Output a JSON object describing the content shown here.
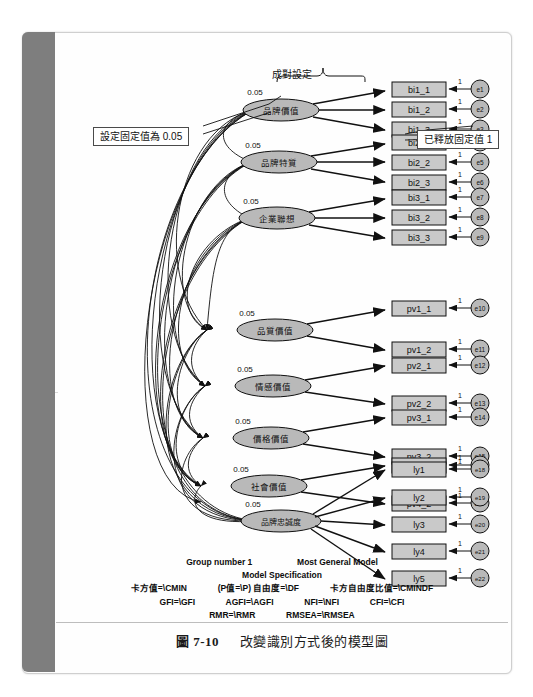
{
  "caption": {
    "number": "圖 7-10",
    "text": "改變識別方式後的模型圖"
  },
  "annotations": {
    "pair_setting": "成對設定",
    "left_callout": "設定固定值為 0.05",
    "right_callout": "已釋放固定值 1"
  },
  "fixed_value_label": "0.05",
  "loading_label": "1",
  "latents": [
    {
      "id": "bi1",
      "label": "品牌價值",
      "fixed": "0.05",
      "indicators": [
        "bi1_1",
        "bi1_2",
        "bi1_3"
      ],
      "errors": [
        "e1",
        "e2",
        "e3"
      ]
    },
    {
      "id": "bi2",
      "label": "品牌特質",
      "fixed": "0.05",
      "indicators": [
        "bi2_1",
        "bi2_2",
        "bi2_3"
      ],
      "errors": [
        "e4",
        "e5",
        "e6"
      ]
    },
    {
      "id": "bi3",
      "label": "企業聯想",
      "fixed": "0.05",
      "indicators": [
        "bi3_1",
        "bi3_2",
        "bi3_3"
      ],
      "errors": [
        "e7",
        "e8",
        "e9"
      ]
    },
    {
      "id": "pv1",
      "label": "品質價值",
      "fixed": "0.05",
      "indicators": [
        "pv1_1",
        "pv1_2"
      ],
      "errors": [
        "e10",
        "e11"
      ]
    },
    {
      "id": "pv2",
      "label": "情感價值",
      "fixed": "0.05",
      "indicators": [
        "pv2_1",
        "pv2_2"
      ],
      "errors": [
        "e12",
        "e13"
      ]
    },
    {
      "id": "pv3",
      "label": "價格價值",
      "fixed": "0.05",
      "indicators": [
        "pv3_1",
        "pv3_2"
      ],
      "errors": [
        "e14",
        "e15"
      ]
    },
    {
      "id": "pv4",
      "label": "社會價值",
      "fixed": "0.05",
      "indicators": [
        "pv4_1",
        "pv4_2"
      ],
      "errors": [
        "e16",
        "e17"
      ]
    },
    {
      "id": "ly",
      "label": "品牌忠誠度",
      "fixed": "0.05",
      "indicators": [
        "ly1",
        "ly2",
        "ly3",
        "ly4",
        "ly5"
      ],
      "errors": [
        "e18",
        "e19",
        "e20",
        "e21",
        "e22"
      ]
    }
  ],
  "footer": {
    "group": "Group number 1",
    "model": "Most General Model",
    "spec": "Model Specification",
    "line3": [
      "卡方值=\\CMIN",
      "(P值=\\P) 自由度=\\DF",
      "卡方自由度比值=\\CMINDF"
    ],
    "line4": [
      "GFI=\\GFI",
      "AGFI=\\AGFI",
      "NFI=\\NFI",
      "CFI=\\CFI"
    ],
    "line5": [
      "RMR=\\RMR",
      "RMSEA=\\RMSEA"
    ]
  },
  "colors": {
    "node_fill": "#b9b9b9",
    "box_fill": "#c9c9c9",
    "spine": "#7e7e7e",
    "stroke": "#111111"
  }
}
